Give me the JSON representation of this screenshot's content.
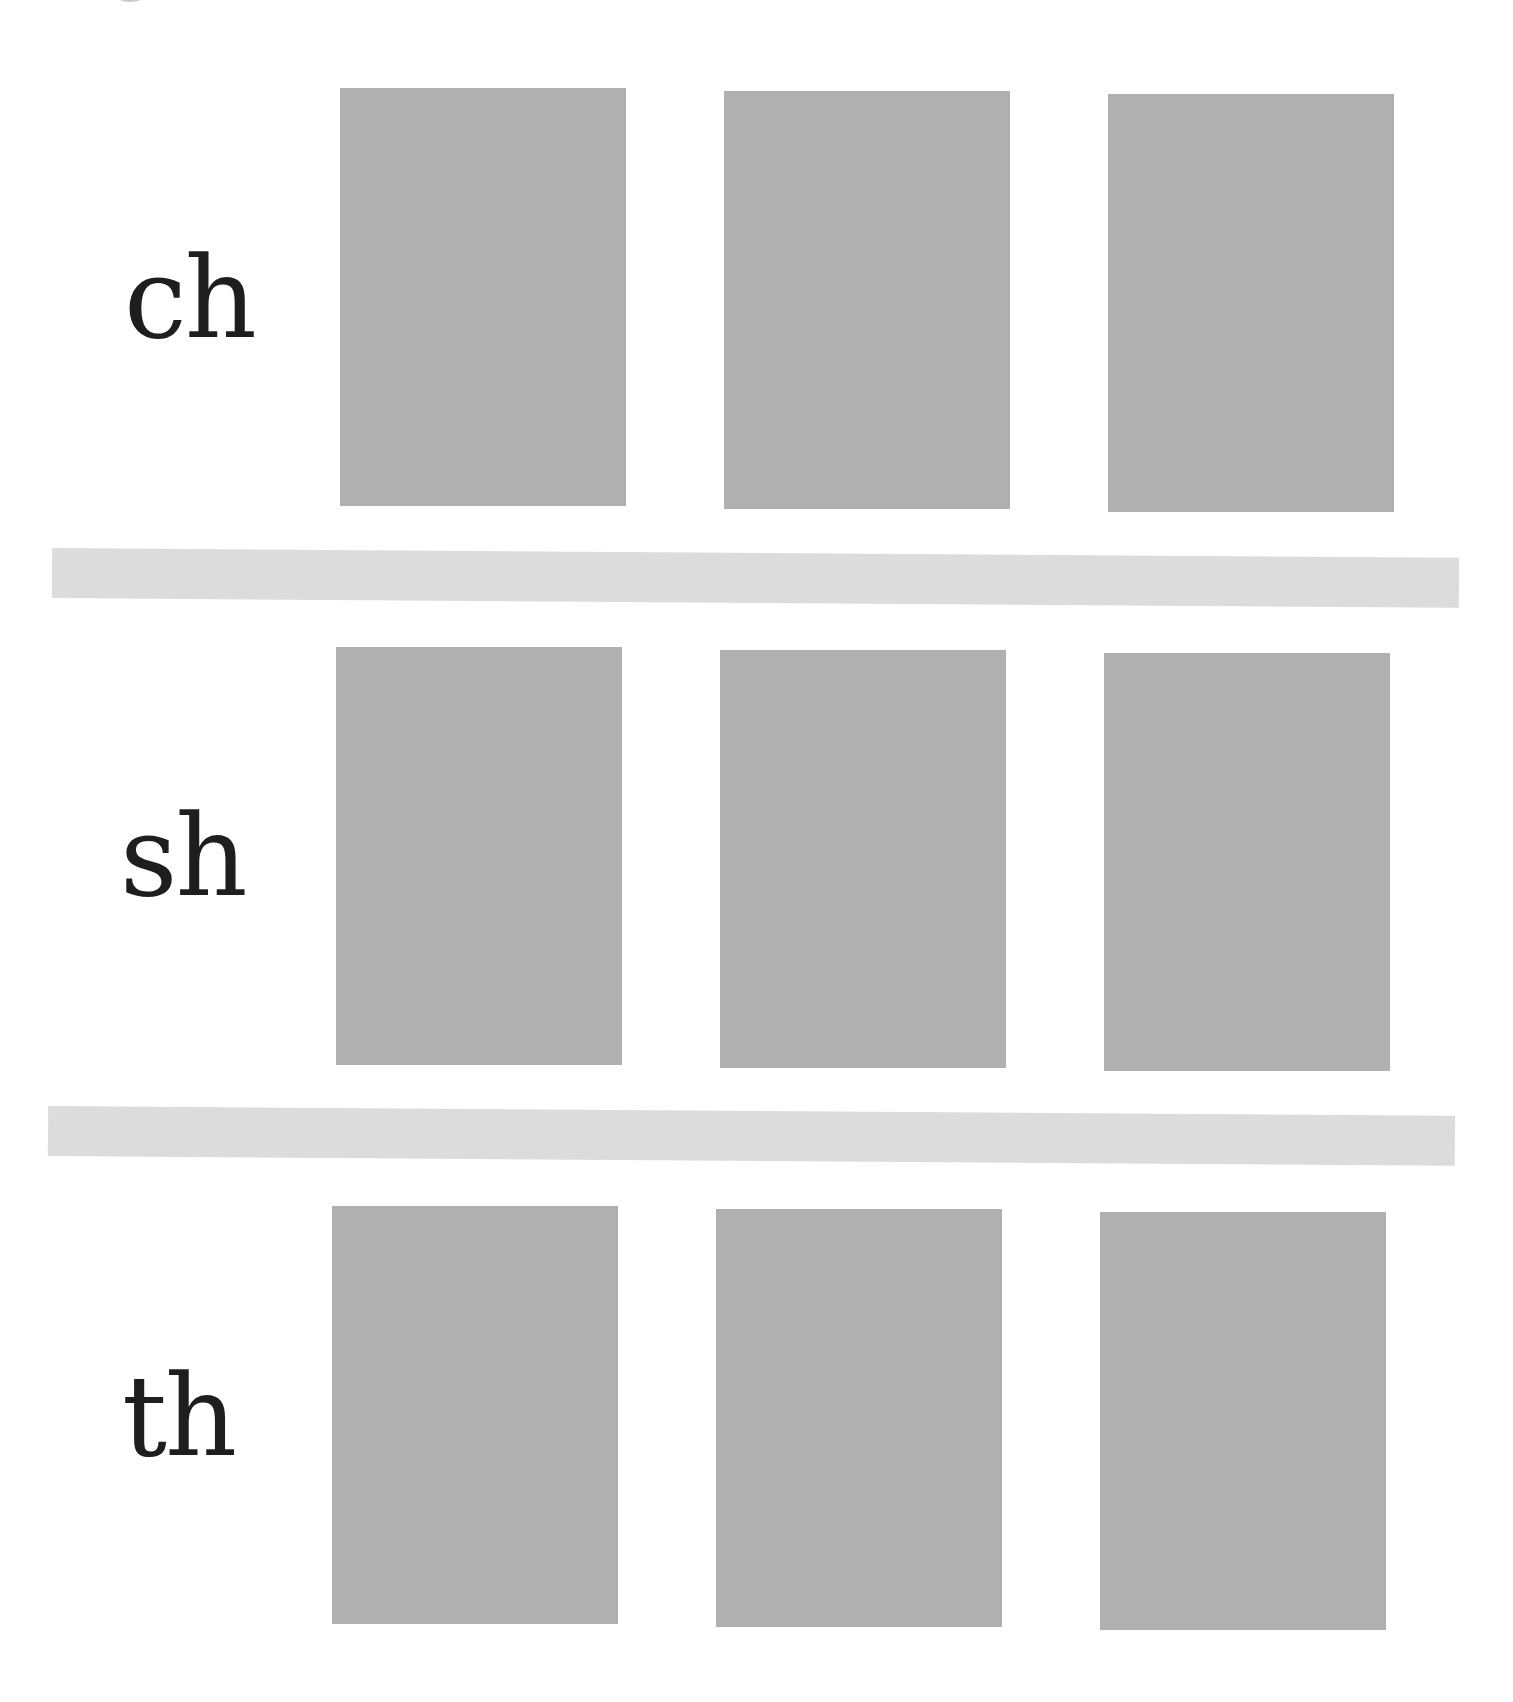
{
  "worksheet": {
    "rows": [
      {
        "label": "ch",
        "cards": [
          "",
          "",
          ""
        ]
      },
      {
        "label": "sh",
        "cards": [
          "",
          "",
          ""
        ]
      },
      {
        "label": "th",
        "cards": [
          "",
          "",
          ""
        ]
      }
    ]
  },
  "colors": {
    "card": "#b0b0b0",
    "divider": "#dcdcdc",
    "text": "#1e1e1e",
    "background": "#ffffff"
  }
}
